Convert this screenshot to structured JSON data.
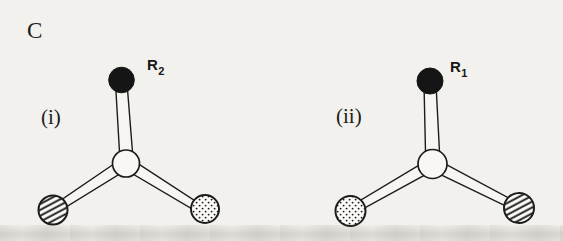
{
  "figure": {
    "panel_label": "C",
    "diagrams": [
      {
        "label": "(i)",
        "substituent_base": "R",
        "substituent_subscript": "2",
        "atoms": {
          "top": "black-filled",
          "bottom_left": "diagonal-hatched",
          "bottom_right": "dotted",
          "center": "open-white"
        }
      },
      {
        "label": "(ii)",
        "substituent_base": "R",
        "substituent_subscript": "1",
        "atoms": {
          "top": "black-filled",
          "bottom_left": "dotted",
          "bottom_right": "diagonal-hatched",
          "center": "open-white"
        }
      }
    ],
    "colors": {
      "ink": "#1c1c1c",
      "paper": "#f2f1ed",
      "atom_black_fill": "#151515",
      "atom_white_fill": "#f8f7f4"
    }
  }
}
